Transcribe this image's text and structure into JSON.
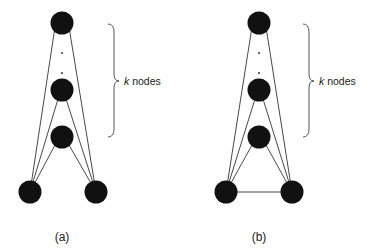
{
  "figures": [
    {
      "id": "a",
      "caption": "(a)",
      "brace_label_var": "k",
      "brace_label_text": " nodes",
      "bottom_edge": false
    },
    {
      "id": "b",
      "caption": "(b)",
      "brace_label_var": "k",
      "brace_label_text": " nodes",
      "bottom_edge": true
    }
  ],
  "colors": {
    "node": "#111111",
    "edge": "#333333",
    "brace": "#444444"
  }
}
